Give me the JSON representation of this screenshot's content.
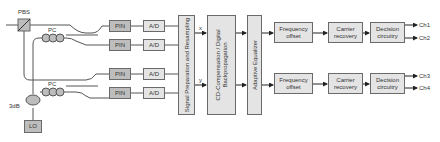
{
  "diagram": {
    "pbs_label": "PBS",
    "pc_top_label": "PC",
    "pc_bottom_label": "PC",
    "coupler_label": "3dB",
    "lo_label": "LO",
    "pin_label": "PIN",
    "ad_label": "A/D",
    "signal_prep_label": "Signal Preparation and Resampling",
    "cd_label": "CD-Compensation / Digital Backpropagation",
    "eq_label": "Adaptive Equalizer",
    "x_label": "x",
    "y_label": "y",
    "freq_label": "Frequency offset",
    "carrier_label": "Carrier recovery",
    "decision_label": "Decision circuitry",
    "channels": [
      "Ch1",
      "Ch2",
      "Ch3",
      "Ch4"
    ]
  },
  "colors": {
    "box_fill": "#e4e4e4",
    "dark_fill": "#bdbdbd",
    "line": "#555555"
  }
}
